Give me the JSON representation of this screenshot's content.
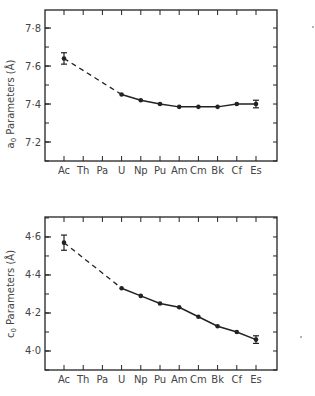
{
  "chart_data": [
    {
      "type": "line",
      "title": "",
      "xlabel": "",
      "ylabel": "a0 Parameters (Å)",
      "ylabel_symbol": "a",
      "ylabel_subscript": "0",
      "ylabel_rest": " Parameters (Å)",
      "categories": [
        "Ac",
        "Th",
        "Pa",
        "U",
        "Np",
        "Pu",
        "Am",
        "Cm",
        "Bk",
        "Cf",
        "Es"
      ],
      "ylim": [
        7.1,
        7.895
      ],
      "yticks": [
        7.2,
        7.4,
        7.6,
        7.8
      ],
      "ytick_labels": [
        "7·2",
        "7·4",
        "7·6",
        "7·8"
      ],
      "minor_step": 0.1,
      "grid": false,
      "series": [
        {
          "name": "a0",
          "values": [
            7.64,
            null,
            null,
            7.45,
            7.42,
            7.4,
            7.385,
            7.385,
            7.385,
            7.4,
            7.4
          ],
          "errors": [
            0.03,
            null,
            null,
            null,
            null,
            null,
            null,
            null,
            null,
            null,
            0.02
          ],
          "dashed_segment": [
            "Ac",
            "U"
          ],
          "solid_segment": [
            "U",
            "Es"
          ]
        }
      ]
    },
    {
      "type": "line",
      "title": "",
      "xlabel": "",
      "ylabel": "c0 Parameters (Å)",
      "ylabel_symbol": "c",
      "ylabel_subscript": "0",
      "ylabel_rest": " Parameters (Å)",
      "categories": [
        "Ac",
        "Th",
        "Pa",
        "U",
        "Np",
        "Pu",
        "Am",
        "Cm",
        "Bk",
        "Cf",
        "Es"
      ],
      "ylim": [
        3.9,
        4.705
      ],
      "yticks": [
        4.0,
        4.2,
        4.4,
        4.6
      ],
      "ytick_labels": [
        "4·0",
        "4·2",
        "4·4",
        "4·6"
      ],
      "minor_step": 0.1,
      "grid": false,
      "series": [
        {
          "name": "c0",
          "values": [
            4.57,
            null,
            null,
            4.33,
            4.29,
            4.25,
            4.23,
            4.18,
            4.13,
            4.1,
            4.06
          ],
          "errors": [
            0.04,
            null,
            null,
            null,
            null,
            null,
            null,
            null,
            null,
            null,
            0.02
          ],
          "dashed_segment": [
            "Ac",
            "U"
          ],
          "solid_segment": [
            "U",
            "Es"
          ]
        }
      ]
    }
  ]
}
